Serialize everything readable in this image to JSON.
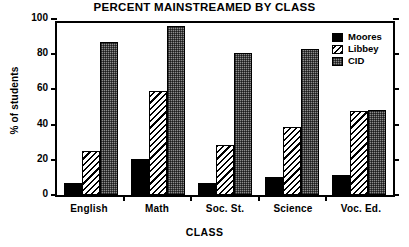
{
  "chart_data": {
    "type": "bar",
    "title": "PERCENT MAINSTREAMED BY CLASS",
    "xlabel": "CLASS",
    "ylabel": "% of students",
    "categories": [
      "English",
      "Math",
      "Soc. St.",
      "Science",
      "Voc. Ed."
    ],
    "series": [
      {
        "name": "Moores",
        "values": [
          7,
          20.5,
          7,
          10,
          11.5
        ],
        "fill": "solid-black",
        "color": "#000000"
      },
      {
        "name": "Libbey",
        "values": [
          25,
          59,
          28.5,
          38.5,
          48
        ],
        "fill": "diagonal-hatch",
        "color": "#000000"
      },
      {
        "name": "CID",
        "values": [
          87,
          96,
          80.5,
          83,
          48.5
        ],
        "fill": "checker-gray",
        "color": "#8c8c8c"
      }
    ],
    "ylim": [
      0,
      100
    ],
    "yticks": [
      0,
      20,
      40,
      60,
      80,
      100
    ],
    "ytick_labels": [
      "0",
      "20",
      "40",
      "60",
      "80",
      "100"
    ],
    "grid": false,
    "legend_position": "top-right"
  }
}
